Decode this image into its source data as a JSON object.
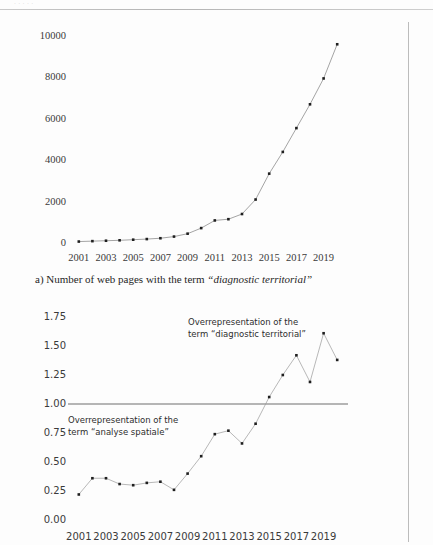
{
  "page": {
    "header_fragment": "· ·   · ·     ·",
    "caption_a_prefix": "a) Number of web pages with the term ",
    "caption_a_term": "“diagnostic territorial”",
    "ink_color": "#2b2b2b",
    "line_color": "#9a9a9a",
    "marker_color": "#1f1f1f",
    "rule_color": "#6f6f6f"
  },
  "chart_data": [
    {
      "id": "chart-a",
      "type": "line",
      "title": "",
      "subtitle": "",
      "caption": "a) Number of web pages with the term “diagnostic territorial”",
      "xlabel": "",
      "ylabel": "",
      "grid": false,
      "legend": "none",
      "xlim": [
        2000.5,
        2020.5
      ],
      "ylim": [
        0,
        10000
      ],
      "yticks": [
        "0",
        "2000",
        "4000",
        "6000",
        "8000",
        "10000"
      ],
      "ytick_values": [
        0,
        2000,
        4000,
        6000,
        8000,
        10000
      ],
      "xticks": [
        "2001",
        "2003",
        "2005",
        "2007",
        "2009",
        "2011",
        "2013",
        "2015",
        "2017",
        "2019"
      ],
      "xtick_values": [
        2001,
        2003,
        2005,
        2007,
        2009,
        2011,
        2013,
        2015,
        2017,
        2019
      ],
      "x": [
        2001,
        2002,
        2003,
        2004,
        2005,
        2006,
        2007,
        2008,
        2009,
        2010,
        2011,
        2012,
        2013,
        2014,
        2015,
        2016,
        2017,
        2018,
        2019,
        2020
      ],
      "values": [
        70,
        90,
        110,
        130,
        160,
        190,
        230,
        310,
        450,
        720,
        1090,
        1150,
        1400,
        2100,
        3350,
        4400,
        5550,
        6700,
        7950,
        9600
      ],
      "series": [
        {
          "name": "Number of web pages",
          "values": [
            70,
            90,
            110,
            130,
            160,
            190,
            230,
            310,
            450,
            720,
            1090,
            1150,
            1400,
            2100,
            3350,
            4400,
            5550,
            6700,
            7950,
            9600
          ]
        }
      ],
      "annotations": []
    },
    {
      "id": "chart-b",
      "type": "line",
      "title": "",
      "subtitle": "",
      "caption": "",
      "xlabel": "",
      "ylabel": "",
      "grid": false,
      "legend": "none",
      "xlim": [
        2000.5,
        2020.5
      ],
      "ylim": [
        0.0,
        1.75
      ],
      "yticks": [
        "0.00",
        "0.25",
        "0.50",
        "0.75",
        "1.00",
        "1.25",
        "1.50",
        "1.75"
      ],
      "ytick_values": [
        0.0,
        0.25,
        0.5,
        0.75,
        1.0,
        1.25,
        1.5,
        1.75
      ],
      "xticks": [
        "2001",
        "2003",
        "2005",
        "2007",
        "2009",
        "2011",
        "2013",
        "2015",
        "2017",
        "2019"
      ],
      "xtick_values": [
        2001,
        2003,
        2005,
        2007,
        2009,
        2011,
        2013,
        2015,
        2017,
        2019
      ],
      "reference_line": 1.0,
      "x": [
        2001,
        2002,
        2003,
        2004,
        2005,
        2006,
        2007,
        2008,
        2009,
        2010,
        2011,
        2012,
        2013,
        2014,
        2015,
        2016,
        2017,
        2018,
        2019,
        2020
      ],
      "values": [
        0.22,
        0.36,
        0.36,
        0.31,
        0.3,
        0.32,
        0.33,
        0.26,
        0.4,
        0.55,
        0.74,
        0.77,
        0.66,
        0.83,
        1.06,
        1.25,
        1.42,
        1.19,
        1.61,
        1.38
      ],
      "series": [
        {
          "name": "Overrepresentation ratio",
          "values": [
            0.22,
            0.36,
            0.36,
            0.31,
            0.3,
            0.32,
            0.33,
            0.26,
            0.4,
            0.55,
            0.74,
            0.77,
            0.66,
            0.83,
            1.06,
            1.25,
            1.42,
            1.19,
            1.61,
            1.38
          ]
        }
      ],
      "annotations": [
        {
          "id": "annot-upper",
          "text": "Overrepresentation of the\nterm “diagnostic territorial”"
        },
        {
          "id": "annot-lower",
          "text": "Overrepresentation of the\nterm “analyse spatiale”"
        }
      ]
    }
  ]
}
